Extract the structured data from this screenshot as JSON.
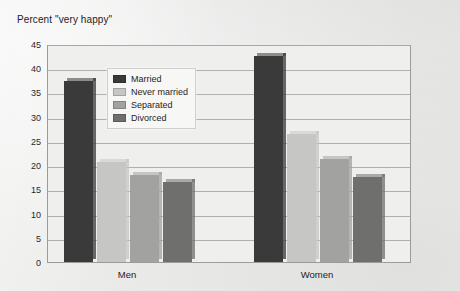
{
  "chart_data": {
    "type": "bar",
    "title": "Percent \"very happy\"",
    "xlabel": "",
    "ylabel": "Percent \"very happy\"",
    "categories": [
      "Men",
      "Women"
    ],
    "series": [
      {
        "name": "Married",
        "values": [
          37.4,
          42.5
        ],
        "color": "#3a3a3a"
      },
      {
        "name": "Never married",
        "values": [
          20.6,
          26.5
        ],
        "color": "#c6c6c4"
      },
      {
        "name": "Separated",
        "values": [
          18.0,
          21.3
        ],
        "color": "#a2a2a0"
      },
      {
        "name": "Divorced",
        "values": [
          16.5,
          17.6
        ],
        "color": "#6f6f6d"
      }
    ],
    "ylim": [
      0,
      45
    ],
    "yticks": [
      0,
      5,
      10,
      15,
      20,
      25,
      30,
      35,
      40,
      45
    ],
    "ytick_labels": [
      "0",
      "5",
      "10",
      "15",
      "20",
      "25",
      "30",
      "35",
      "40",
      "45"
    ],
    "grid": true,
    "legend_position": "upper-center-left",
    "legend_entries": [
      "Married",
      "Never married",
      "Separated",
      "Divorced"
    ],
    "background_color": "#ececeb",
    "plot_background_color": "#efefee",
    "gridline_color": "#b0b0ae",
    "frame_color": "#9b9b99"
  }
}
